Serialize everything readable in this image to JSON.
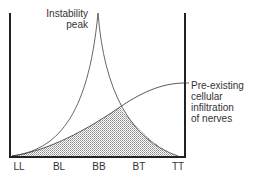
{
  "diagram": {
    "x_categories": [
      "LL",
      "BL",
      "BB",
      "BT",
      "TT"
    ],
    "curves": [
      {
        "name": "Instability peak",
        "label_lines": [
          "Instability",
          "peak"
        ]
      },
      {
        "name": "Pre-existing cellular infiltration of nerves",
        "label_lines": [
          "Pre-existing",
          "cellular",
          "infiltration",
          "of nerves"
        ]
      }
    ],
    "shaded_region": "overlap under both curves",
    "colors": {
      "axis": "#222222",
      "curve": "#555555",
      "fill": "#cccccc",
      "text": "#333333"
    }
  }
}
